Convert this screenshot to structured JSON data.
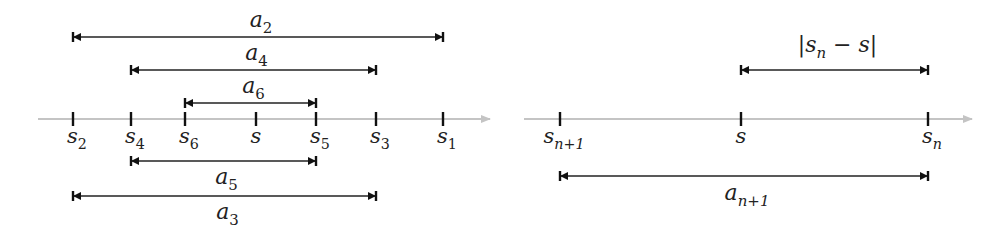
{
  "left_panel": {
    "axis": {
      "x_start": 38,
      "x_end": 490,
      "y": 119
    },
    "ticks": [
      {
        "x": 73,
        "base": "s",
        "sub": "2"
      },
      {
        "x": 131,
        "base": "s",
        "sub": "4"
      },
      {
        "x": 185,
        "base": "s",
        "sub": "6"
      },
      {
        "x": 256,
        "base": "s",
        "sub": ""
      },
      {
        "x": 316,
        "base": "s",
        "sub": "5"
      },
      {
        "x": 376,
        "base": "s",
        "sub": "3"
      },
      {
        "x": 443,
        "base": "s",
        "sub": "1"
      }
    ],
    "spans": [
      {
        "x1": 73,
        "x2": 443,
        "y": 37,
        "label_y": 27,
        "base": "a",
        "sub": "2"
      },
      {
        "x1": 131,
        "x2": 376,
        "y": 70,
        "label_y": 60,
        "base": "a",
        "sub": "4"
      },
      {
        "x1": 185,
        "x2": 316,
        "y": 103,
        "label_y": 93,
        "base": "a",
        "sub": "6"
      },
      {
        "x1": 131,
        "x2": 316,
        "y": 161,
        "label_y": 184,
        "base": "a",
        "sub": "5"
      },
      {
        "x1": 73,
        "x2": 376,
        "y": 196,
        "label_y": 219,
        "base": "a",
        "sub": "3"
      }
    ]
  },
  "right_panel": {
    "axis": {
      "x_start": 524,
      "x_end": 972,
      "y": 119
    },
    "ticks": [
      {
        "x": 560,
        "base": "s",
        "sub": "n+1"
      },
      {
        "x": 741,
        "base": "s",
        "sub": ""
      },
      {
        "x": 928,
        "base": "s",
        "sub": "n"
      }
    ],
    "spans": [
      {
        "x1": 741,
        "x2": 928,
        "y": 70,
        "label_y": 52,
        "label": "|s_n − s|",
        "base": "|s",
        "sub": "n",
        "tail": " − s|"
      },
      {
        "x1": 560,
        "x2": 928,
        "y": 176,
        "label_y": 200,
        "base": "a",
        "sub": "n+1"
      }
    ]
  },
  "colors": {
    "axis": "#c4c4c4",
    "ink": "#222222"
  }
}
